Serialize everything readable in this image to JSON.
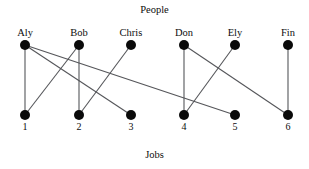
{
  "diagram": {
    "type": "bipartite-graph",
    "top_title": "People",
    "bottom_title": "Jobs",
    "people": [
      {
        "id": "aly",
        "label": "Aly",
        "x": 25,
        "y": 45
      },
      {
        "id": "bob",
        "label": "Bob",
        "x": 79,
        "y": 45
      },
      {
        "id": "chris",
        "label": "Chris",
        "x": 131,
        "y": 45
      },
      {
        "id": "don",
        "label": "Don",
        "x": 184,
        "y": 45
      },
      {
        "id": "ely",
        "label": "Ely",
        "x": 235,
        "y": 45
      },
      {
        "id": "fin",
        "label": "Fin",
        "x": 288,
        "y": 45
      }
    ],
    "jobs": [
      {
        "id": "j1",
        "label": "1",
        "x": 25,
        "y": 115
      },
      {
        "id": "j2",
        "label": "2",
        "x": 79,
        "y": 115
      },
      {
        "id": "j3",
        "label": "3",
        "x": 131,
        "y": 115
      },
      {
        "id": "j4",
        "label": "4",
        "x": 184,
        "y": 115
      },
      {
        "id": "j5",
        "label": "5",
        "x": 235,
        "y": 115
      },
      {
        "id": "j6",
        "label": "6",
        "x": 288,
        "y": 115
      }
    ],
    "edges": [
      {
        "from": "aly",
        "to": "j1"
      },
      {
        "from": "aly",
        "to": "j3"
      },
      {
        "from": "aly",
        "to": "j5"
      },
      {
        "from": "bob",
        "to": "j1"
      },
      {
        "from": "bob",
        "to": "j2"
      },
      {
        "from": "chris",
        "to": "j2"
      },
      {
        "from": "don",
        "to": "j4"
      },
      {
        "from": "don",
        "to": "j6"
      },
      {
        "from": "ely",
        "to": "j4"
      },
      {
        "from": "fin",
        "to": "j6"
      }
    ],
    "style": {
      "node_radius": 5,
      "node_color": "#0a0a0a",
      "edge_color": "#55565a",
      "background": "#ffffff"
    }
  }
}
